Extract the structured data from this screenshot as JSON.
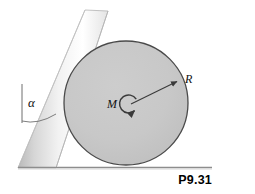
{
  "figure": {
    "number": "P9.31",
    "background_color": "#ffffff"
  },
  "labels": {
    "angle": "α",
    "mass": "M",
    "radius": "R"
  },
  "cylinder": {
    "name": "cylinder",
    "fill_color": "#c9c9c9",
    "stroke_color": "#4a4a4a",
    "center_x": 126,
    "center_y": 103,
    "radius": 62
  },
  "ramp": {
    "name": "inclined-ramp",
    "fill_light": "#ffffff",
    "fill_mid": "#e8e8e8",
    "fill_dark": "#b8b8b8",
    "stroke_color": "#9a9a9a",
    "angle_from_vertical_label": "α"
  },
  "ground": {
    "name": "ground-line",
    "stroke_color": "#8d8d8d",
    "x_start": 18,
    "x_end": 212,
    "y": 167
  },
  "angle_marker": {
    "name": "angle-alpha-marker",
    "vertical_reference_x": 22,
    "vertical_top_y": 84,
    "vertical_bottom_y": 123,
    "arc_stroke_color": "#6f6f6f"
  },
  "radius_arrow": {
    "name": "radius-arrow",
    "from_x": 130,
    "from_y": 104,
    "to_x": 178,
    "to_y": 81,
    "stroke_color": "#3a3a3a"
  },
  "rotation_arrow": {
    "name": "rotation-arrow",
    "center_x": 129,
    "center_y": 104,
    "radius": 9,
    "stroke_color": "#3a3a3a"
  }
}
